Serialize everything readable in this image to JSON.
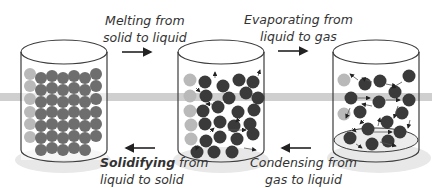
{
  "diagram": {
    "states": [
      {
        "name": "solid",
        "particle_color": "#6e6e6e",
        "arrangement": "close-packed lattice"
      },
      {
        "name": "liquid",
        "particle_color": "#3a3a3a",
        "arrangement": "close, random, with motion arrows"
      },
      {
        "name": "gas",
        "particle_color": "#3a3a3a",
        "arrangement": "widely spaced, with motion arrows"
      }
    ],
    "transitions": [
      {
        "id": "melting",
        "line1": "Melting from",
        "line2": "solid to liquid",
        "direction": "right"
      },
      {
        "id": "evaporating",
        "line1": "Evaporating from",
        "line2": "liquid to gas",
        "direction": "right"
      },
      {
        "id": "solidifying",
        "bold": "Solidifying",
        "line1_rest": " from",
        "line2": "liquid to solid",
        "direction": "left"
      },
      {
        "id": "condensing",
        "line1": "Condensing from",
        "line2": "gas to liquid",
        "direction": "left"
      }
    ],
    "colors": {
      "outline": "#3c3c3c",
      "band": "#c8c8c8",
      "base_shadow": "#e6e6e6",
      "arrow": "#222222"
    }
  }
}
